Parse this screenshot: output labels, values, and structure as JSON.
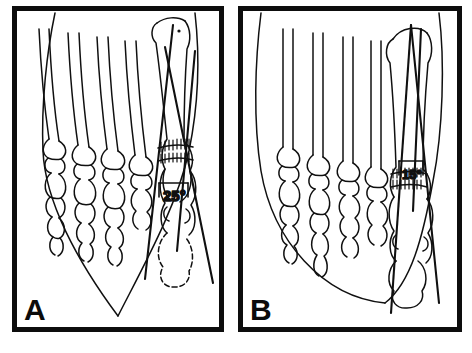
{
  "figure": {
    "type": "medical-line-illustration",
    "background_color": "#ffffff",
    "ink_color": "#101010",
    "frame_color": "#0d0d0d"
  },
  "panels": [
    {
      "id": "A",
      "label": "A",
      "stage": "preoperative",
      "angle_label": "25°",
      "angle_value": 25,
      "angle_unit": "degrees",
      "soft_tissue_outline": "pointed",
      "osteotomy_marking": "hatched transverse band at first metatarsal neck",
      "bones_drawn": [
        "first metatarsal",
        "second metatarsal",
        "third metatarsal",
        "fourth metatarsal",
        "fifth metatarsal",
        "proximal phalanges",
        "middle phalanges",
        "distal phalanges",
        "hallux proximal phalanx",
        "hallux distal phalanx",
        "sesamoids"
      ],
      "measurement_lines": 3
    },
    {
      "id": "B",
      "label": "B",
      "stage": "postoperative",
      "angle_label": "15°",
      "angle_value": 15,
      "angle_unit": "degrees",
      "soft_tissue_outline": "rounded",
      "osteotomy_marking": "hatched transverse band at first metatarsal neck",
      "bones_drawn": [
        "first metatarsal",
        "second metatarsal",
        "third metatarsal",
        "fourth metatarsal",
        "fifth metatarsal",
        "proximal phalanges",
        "middle phalanges",
        "distal phalanges",
        "hallux proximal phalanx",
        "hallux distal phalanx",
        "sesamoids"
      ],
      "measurement_lines": 3
    }
  ],
  "caption": {
    "visible_fragment": ""
  }
}
